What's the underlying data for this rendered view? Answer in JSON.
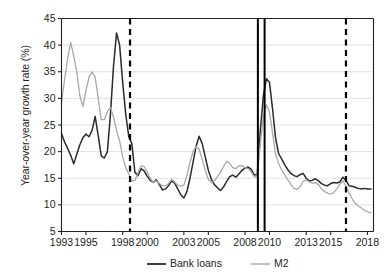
{
  "chart_data": {
    "type": "line",
    "title": "",
    "xlabel": "",
    "ylabel": "Year-over-year growth rate (%)",
    "xlim": [
      1993.0,
      2018.5
    ],
    "ylim": [
      5,
      45
    ],
    "yticks": [
      5,
      10,
      15,
      20,
      25,
      30,
      35,
      40,
      45
    ],
    "xticks": [
      1993,
      1995,
      1998,
      2000,
      2003,
      2005,
      2008,
      2010,
      2013,
      2015,
      2018
    ],
    "ytick_labels": [
      "5",
      "10",
      "15",
      "20",
      "25",
      "30",
      "35",
      "40",
      "45"
    ],
    "xtick_labels": [
      "1993",
      "1995",
      "1998",
      "2000",
      "2003",
      "2005",
      "2008",
      "2010",
      "2013",
      "2015",
      "2018"
    ],
    "grid": "horizontal",
    "legend_position": "below",
    "colors": {
      "bank_loans": "#2b2b2b",
      "m2": "#a8a8a8",
      "axis": "#231f20",
      "gridline": "#d9d9d9",
      "event_line": "#000000",
      "dashed_line": "#000000",
      "background": "#ffffff"
    },
    "annotations": [
      {
        "name": "dashed-line-1998",
        "type": "vertical-dashed",
        "x": 1998.6
      },
      {
        "name": "solid-line-2009a",
        "type": "vertical-solid",
        "x": 2009.05
      },
      {
        "name": "solid-line-2009b",
        "type": "vertical-solid",
        "x": 2009.6
      },
      {
        "name": "dashed-line-2016",
        "type": "vertical-dashed",
        "x": 2016.25
      }
    ],
    "series": [
      {
        "name": "Bank loans",
        "color": "#2b2b2b",
        "x": [
          1993.0,
          1993.25,
          1993.5,
          1993.75,
          1994.0,
          1994.25,
          1994.5,
          1994.75,
          1995.0,
          1995.25,
          1995.5,
          1995.75,
          1996.0,
          1996.25,
          1996.5,
          1996.75,
          1997.0,
          1997.25,
          1997.5,
          1997.75,
          1998.0,
          1998.25,
          1998.5,
          1998.75,
          1999.0,
          1999.25,
          1999.5,
          1999.75,
          2000.0,
          2000.25,
          2000.5,
          2000.75,
          2001.0,
          2001.25,
          2001.5,
          2001.75,
          2002.0,
          2002.25,
          2002.5,
          2002.75,
          2003.0,
          2003.25,
          2003.5,
          2003.75,
          2004.0,
          2004.25,
          2004.5,
          2004.75,
          2005.0,
          2005.25,
          2005.5,
          2005.75,
          2006.0,
          2006.25,
          2006.5,
          2006.75,
          2007.0,
          2007.25,
          2007.5,
          2007.75,
          2008.0,
          2008.25,
          2008.5,
          2008.75,
          2009.0,
          2009.25,
          2009.5,
          2009.75,
          2010.0,
          2010.25,
          2010.5,
          2010.75,
          2011.0,
          2011.25,
          2011.5,
          2011.75,
          2012.0,
          2012.25,
          2012.5,
          2012.75,
          2013.0,
          2013.25,
          2013.5,
          2013.75,
          2014.0,
          2014.25,
          2014.5,
          2014.75,
          2015.0,
          2015.25,
          2015.5,
          2015.75,
          2016.0,
          2016.25,
          2016.5,
          2016.75,
          2017.0,
          2017.25,
          2017.5,
          2017.75,
          2018.0,
          2018.3
        ],
        "values": [
          23.4,
          21.8,
          20.6,
          19.3,
          17.7,
          19.5,
          21.3,
          22.6,
          23.3,
          22.8,
          24.0,
          26.6,
          23.0,
          19.2,
          18.8,
          20.0,
          27.0,
          36.0,
          42.3,
          40.0,
          33.0,
          27.0,
          22.8,
          21.5,
          16.1,
          15.5,
          16.8,
          16.4,
          15.4,
          14.6,
          14.2,
          14.7,
          13.8,
          12.8,
          13.0,
          13.6,
          14.5,
          14.1,
          13.0,
          11.9,
          11.3,
          12.5,
          15.0,
          18.0,
          21.0,
          22.9,
          21.5,
          19.0,
          16.5,
          14.8,
          13.8,
          13.2,
          12.7,
          13.4,
          14.4,
          15.3,
          15.6,
          15.2,
          15.8,
          16.5,
          16.9,
          17.1,
          16.7,
          15.6,
          15.7,
          24.0,
          30.5,
          33.7,
          33.0,
          28.0,
          22.5,
          19.6,
          18.6,
          17.5,
          16.6,
          15.9,
          15.5,
          15.3,
          15.7,
          15.9,
          15.0,
          14.5,
          14.6,
          14.9,
          14.5,
          14.0,
          13.7,
          13.6,
          14.0,
          14.2,
          14.1,
          14.3,
          15.2,
          14.6,
          13.6,
          13.5,
          13.3,
          13.1,
          13.0,
          13.1,
          13.0,
          13.0
        ]
      },
      {
        "name": "M2",
        "color": "#a8a8a8",
        "x": [
          1993.0,
          1993.25,
          1993.5,
          1993.75,
          1994.0,
          1994.25,
          1994.5,
          1994.75,
          1995.0,
          1995.25,
          1995.5,
          1995.75,
          1996.0,
          1996.25,
          1996.5,
          1996.75,
          1997.0,
          1997.25,
          1997.5,
          1997.75,
          1998.0,
          1998.25,
          1998.5,
          1998.75,
          1999.0,
          1999.25,
          1999.5,
          1999.75,
          2000.0,
          2000.25,
          2000.5,
          2000.75,
          2001.0,
          2001.25,
          2001.5,
          2001.75,
          2002.0,
          2002.25,
          2002.5,
          2002.75,
          2003.0,
          2003.25,
          2003.5,
          2003.75,
          2004.0,
          2004.25,
          2004.5,
          2004.75,
          2005.0,
          2005.25,
          2005.5,
          2005.75,
          2006.0,
          2006.25,
          2006.5,
          2006.75,
          2007.0,
          2007.25,
          2007.5,
          2007.75,
          2008.0,
          2008.25,
          2008.5,
          2008.75,
          2009.0,
          2009.25,
          2009.5,
          2009.75,
          2010.0,
          2010.25,
          2010.5,
          2010.75,
          2011.0,
          2011.25,
          2011.5,
          2011.75,
          2012.0,
          2012.25,
          2012.5,
          2012.75,
          2013.0,
          2013.25,
          2013.5,
          2013.75,
          2014.0,
          2014.25,
          2014.5,
          2014.75,
          2015.0,
          2015.25,
          2015.5,
          2015.75,
          2016.0,
          2016.25,
          2016.5,
          2016.75,
          2017.0,
          2017.25,
          2017.5,
          2017.75,
          2018.0,
          2018.3
        ],
        "values": [
          29.2,
          33.5,
          37.5,
          40.5,
          38.0,
          35.0,
          30.5,
          28.5,
          31.5,
          34.0,
          35.0,
          34.0,
          30.0,
          26.0,
          26.0,
          27.5,
          28.3,
          26.5,
          24.0,
          22.0,
          19.0,
          17.0,
          15.8,
          14.5,
          14.6,
          16.0,
          17.3,
          17.2,
          16.2,
          15.0,
          14.2,
          14.5,
          14.0,
          13.6,
          13.6,
          14.0,
          14.8,
          14.3,
          13.7,
          13.5,
          13.7,
          15.5,
          18.0,
          20.0,
          21.0,
          20.5,
          18.5,
          16.5,
          14.8,
          14.2,
          14.5,
          15.3,
          16.2,
          17.2,
          18.2,
          17.8,
          17.0,
          16.8,
          17.3,
          17.4,
          17.0,
          16.8,
          16.2,
          15.3,
          15.2,
          21.5,
          26.5,
          28.8,
          27.5,
          23.5,
          19.5,
          17.8,
          16.5,
          15.6,
          14.7,
          13.8,
          13.1,
          12.9,
          13.4,
          14.4,
          14.7,
          14.3,
          14.1,
          14.2,
          13.8,
          13.0,
          12.5,
          12.2,
          12.0,
          12.3,
          13.0,
          13.9,
          14.5,
          13.5,
          12.2,
          11.2,
          10.3,
          9.8,
          9.4,
          9.0,
          8.7,
          8.5
        ]
      }
    ],
    "legend": [
      {
        "label": "Bank loans",
        "color": "#2b2b2b"
      },
      {
        "label": "M2",
        "color": "#a8a8a8"
      }
    ]
  }
}
